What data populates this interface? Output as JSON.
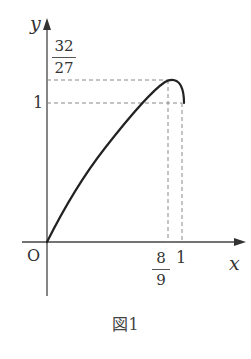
{
  "figure": {
    "caption": "図1",
    "axes": {
      "x_label": "x",
      "y_label": "y",
      "origin_label": "O"
    },
    "x_ticks": [
      {
        "label_num": "8",
        "label_den": "9",
        "value": "8/9"
      },
      {
        "label": "1",
        "value": "1"
      }
    ],
    "y_ticks": [
      {
        "label_num": "32",
        "label_den": "27",
        "value": "32/27"
      },
      {
        "label": "1",
        "value": "1"
      }
    ],
    "curve": {
      "description": "Curve from origin rising to maximum at (8/9, 32/27) then dropping to (1, 1)",
      "start": "(0,0)",
      "max_point": "(8/9, 32/27)",
      "end_point": "(1, 1)"
    },
    "colors": {
      "stroke": "#222222",
      "dash": "#888888",
      "text": "#333333"
    }
  }
}
